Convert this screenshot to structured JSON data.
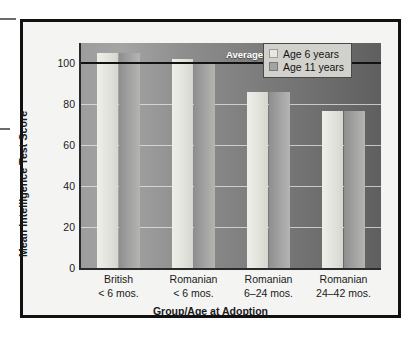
{
  "chart_data": {
    "type": "bar",
    "title": "",
    "xlabel": "Group/Age at Adoption",
    "ylabel": "Mean Intelligence Test Score",
    "ylim": [
      0,
      110
    ],
    "yticks": [
      0,
      20,
      40,
      60,
      80,
      100
    ],
    "grid": true,
    "legend_position": "top-right",
    "categories": [
      "British\n< 6 mos.",
      "Romanian\n< 6 mos.",
      "Romanian\n6–24 mos.",
      "Romanian\n24–42 mos."
    ],
    "category_lines": [
      {
        "line1": "British",
        "line2": "< 6 mos."
      },
      {
        "line1": "Romanian",
        "line2": "< 6 mos."
      },
      {
        "line1": "Romanian",
        "line2": "6–24 mos."
      },
      {
        "line1": "Romanian",
        "line2": "24–42 mos."
      }
    ],
    "series": [
      {
        "name": "Age 6 years",
        "color": "#e8e8e2",
        "values": [
          105,
          102,
          86,
          77
        ]
      },
      {
        "name": "Age 11 years",
        "color": "#a3a3a3",
        "values": [
          105,
          100,
          86,
          77
        ]
      }
    ],
    "annotations": [
      {
        "label": "Average Score",
        "type": "reference-line",
        "value": 100,
        "color": "#121212"
      }
    ]
  },
  "axis": {
    "y_title": "Mean Intelligence Test Score",
    "x_title": "Group/Age at Adoption",
    "y_tick_labels": [
      "100",
      "80",
      "60",
      "40",
      "20",
      "0"
    ]
  },
  "legend": {
    "entries": [
      {
        "label": "Age 6 years",
        "swatch": "#e8e8e2"
      },
      {
        "label": "Age 11 years",
        "swatch": "#a3a3a3"
      }
    ]
  },
  "reference": {
    "average_score_label": "Average Score"
  }
}
